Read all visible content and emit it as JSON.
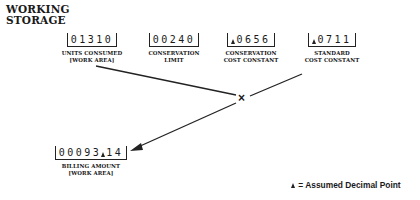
{
  "title": {
    "line1": "WORKING",
    "line2": "STORAGE"
  },
  "fields": {
    "units_consumed": {
      "value": "01310",
      "label1": "UNITS CONSUMED",
      "label2": "[WORK AREA]"
    },
    "conservation_limit": {
      "value": "00240",
      "label1": "CONSERVATION",
      "label2": "LIMIT"
    },
    "conservation_cost_constant": {
      "value": "0656",
      "label1": "CONSERVATION",
      "label2": "COST CONSTANT"
    },
    "standard_cost_constant": {
      "value": "0711",
      "label1": "STANDARD",
      "label2": "COST CONSTANT"
    },
    "billing_amount": {
      "integer_part": "00093",
      "decimal_part": "14",
      "label1": "BILLING AMOUNT",
      "label2": "[WORK AREA]"
    }
  },
  "operator": "×",
  "legend": {
    "symbol": "assumed-decimal-marker",
    "text": "= Assumed Decimal Point"
  }
}
